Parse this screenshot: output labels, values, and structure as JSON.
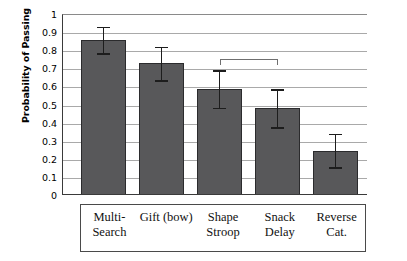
{
  "chart_data": {
    "type": "bar",
    "title": "",
    "xlabel": "",
    "ylabel": "Probability of Passing",
    "ylim": [
      0,
      1
    ],
    "grid": true,
    "legend": null,
    "categories": [
      "Multi-\nSearch",
      "Gift (bow)",
      "Shape\nStroop",
      "Snack\nDelay",
      "Reverse\nCat."
    ],
    "values": [
      0.855,
      0.73,
      0.585,
      0.48,
      0.245
    ],
    "error_upper": [
      0.935,
      0.825,
      0.695,
      0.59,
      0.345
    ],
    "error_lower": [
      0.78,
      0.63,
      0.478,
      0.37,
      0.15
    ],
    "ytick_labels": [
      "1",
      "0.9",
      "0.8",
      "0.7",
      "0.6",
      "0.5",
      "0.4",
      "0.3",
      "0.2",
      "0.1",
      "0"
    ],
    "ytick_values": [
      1,
      0.9,
      0.8,
      0.7,
      0.6,
      0.5,
      0.4,
      0.3,
      0.2,
      0.1,
      0
    ],
    "annotations": [
      {
        "type": "significance-bracket",
        "from_category": "Shape\nStroop",
        "to_category": "Snack\nDelay",
        "y": 0.755,
        "label": ""
      }
    ],
    "series_color": "#58585a",
    "grid_color": "#a9a9a9",
    "axis_color": "#3a3a3a",
    "error_bar_color": "#1d1d1d"
  }
}
